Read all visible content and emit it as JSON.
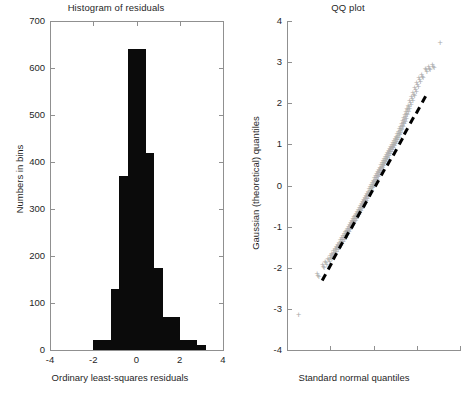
{
  "figure": {
    "width": 464,
    "height": 397,
    "background": "#ffffff",
    "bar_color": "#0b0b0b",
    "point_color": "#a9a9a9",
    "reference_line_color": "#000000",
    "axis_color": "#909090"
  },
  "panels": [
    {
      "id": "histogram",
      "title": "Histogram of residuals",
      "xlabel": "Ordinary least-squares residuals",
      "ylabel": "Numbers in bins",
      "xticks": [
        "-4",
        "-2",
        "0",
        "2",
        "4"
      ],
      "yticks": [
        "0",
        "100",
        "200",
        "300",
        "400",
        "500",
        "600",
        "700"
      ]
    },
    {
      "id": "qqplot",
      "title": "QQ plot",
      "xlabel": "Standard normal quantiles",
      "ylabel": "Gaussian (theoretical) quantiles",
      "xticks": [
        "",
        "",
        "",
        "",
        ""
      ],
      "yticks": [
        "-4",
        "-3",
        "-2",
        "-1",
        "0",
        "1",
        "2",
        "3",
        "4"
      ]
    }
  ],
  "chart_data": [
    {
      "type": "bar",
      "title": "Histogram of residuals",
      "xlabel": "Ordinary least-squares residuals",
      "ylabel": "Numbers in bins",
      "xlim": [
        -4,
        4
      ],
      "ylim": [
        0,
        700
      ],
      "grid": false,
      "legend": "none",
      "bin_width": 0.4,
      "bin_left_edges": [
        -2.0,
        -1.6,
        -1.2,
        -0.8,
        -0.4,
        0.0,
        0.4,
        0.8,
        1.2,
        1.6,
        2.0,
        2.4,
        2.8
      ],
      "bin_centers": [
        -1.8,
        -1.4,
        -1.0,
        -0.6,
        -0.2,
        0.2,
        0.6,
        1.0,
        1.4,
        1.8,
        2.2,
        2.6,
        3.0
      ],
      "values": [
        22,
        22,
        130,
        370,
        640,
        640,
        420,
        175,
        70,
        70,
        22,
        22,
        10
      ],
      "categories": [
        "-1.8",
        "-1.4",
        "-1.0",
        "-0.6",
        "-0.2",
        "0.2",
        "0.6",
        "1.0",
        "1.4",
        "1.8",
        "2.2",
        "2.6",
        "3.0"
      ]
    },
    {
      "type": "scatter",
      "title": "QQ plot",
      "xlabel": "Standard normal quantiles",
      "ylabel": "Gaussian (theoretical) quantiles",
      "xlim": [
        -4,
        4
      ],
      "ylim": [
        -4,
        4
      ],
      "grid": false,
      "legend": "none",
      "series": [
        {
          "name": "sample quantiles",
          "marker": "+",
          "color": "#a9a9a9",
          "x": [
            -3.45,
            -2.55,
            -2.3,
            -2.18,
            -2.05,
            -1.95,
            -1.88,
            -1.8,
            -1.72,
            -1.66,
            -1.6,
            -1.54,
            -1.48,
            -1.42,
            -1.36,
            -1.3,
            -1.25,
            -1.2,
            -1.15,
            -1.1,
            -1.05,
            -1.0,
            -0.95,
            -0.9,
            -0.85,
            -0.8,
            -0.75,
            -0.7,
            -0.65,
            -0.6,
            -0.55,
            -0.5,
            -0.45,
            -0.4,
            -0.35,
            -0.3,
            -0.25,
            -0.2,
            -0.15,
            -0.1,
            -0.05,
            0.0,
            0.05,
            0.1,
            0.15,
            0.2,
            0.25,
            0.3,
            0.35,
            0.4,
            0.45,
            0.5,
            0.55,
            0.6,
            0.65,
            0.7,
            0.75,
            0.8,
            0.85,
            0.9,
            0.95,
            1.0,
            1.05,
            1.1,
            1.15,
            1.2,
            1.25,
            1.3,
            1.35,
            1.4,
            1.45,
            1.5,
            1.55,
            1.6,
            1.65,
            1.72,
            1.8,
            1.88,
            1.96,
            2.05,
            2.15,
            2.28,
            2.45,
            2.6,
            2.78,
            3.1
          ],
          "y": [
            -3.18,
            -2.22,
            -2.0,
            -1.92,
            -1.84,
            -1.78,
            -1.72,
            -1.66,
            -1.6,
            -1.55,
            -1.5,
            -1.45,
            -1.4,
            -1.35,
            -1.3,
            -1.25,
            -1.2,
            -1.16,
            -1.12,
            -1.07,
            -1.02,
            -0.97,
            -0.92,
            -0.88,
            -0.84,
            -0.8,
            -0.75,
            -0.7,
            -0.66,
            -0.61,
            -0.56,
            -0.51,
            -0.46,
            -0.41,
            -0.36,
            -0.31,
            -0.26,
            -0.21,
            -0.16,
            -0.11,
            -0.05,
            0.0,
            0.05,
            0.11,
            0.16,
            0.21,
            0.27,
            0.32,
            0.37,
            0.43,
            0.48,
            0.53,
            0.58,
            0.63,
            0.68,
            0.73,
            0.78,
            0.83,
            0.88,
            0.92,
            0.97,
            1.02,
            1.07,
            1.12,
            1.18,
            1.24,
            1.3,
            1.36,
            1.43,
            1.5,
            1.57,
            1.64,
            1.72,
            1.8,
            1.88,
            1.98,
            2.08,
            2.18,
            2.3,
            2.42,
            2.54,
            2.62,
            2.78,
            2.82,
            2.86,
            3.45
          ]
        }
      ],
      "reference_line": {
        "name": "reference line",
        "style": "dashed",
        "color": "#000000",
        "x": [
          -2.4,
          2.45
        ],
        "y": [
          -2.3,
          2.2
        ]
      }
    }
  ]
}
